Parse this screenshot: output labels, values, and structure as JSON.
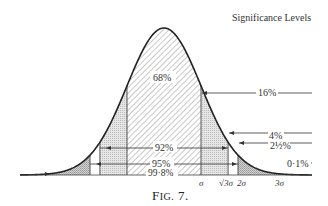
{
  "figure": {
    "title": "Significance Levels",
    "caption_prefix": "F",
    "caption_smallcaps": "IG.",
    "caption_number": " 7."
  },
  "labels": {
    "central": "68%",
    "right_16": "16%",
    "right_4": "4%",
    "right_2_5": "2½%",
    "right_0_1": "0·1%",
    "inner_92": "92%",
    "inner_95": "95%",
    "inner_99_8": "99·8%"
  },
  "axis": {
    "ticks": [
      "σ",
      "√3σ",
      "2σ",
      "3σ"
    ]
  },
  "chart_data": {
    "type": "area",
    "title": "Significance Levels",
    "caption": "Fig. 7.",
    "x_ticks": [
      "σ",
      "√3σ",
      "2σ",
      "3σ"
    ],
    "regions": [
      {
        "range": "-σ to σ",
        "percent_inside": 68,
        "tail_right": 16
      },
      {
        "range": "-√3σ to √3σ",
        "percent_inside": 92,
        "tail_right": 4
      },
      {
        "range": "-2σ to 2σ",
        "percent_inside": 95,
        "tail_right": 2.5
      },
      {
        "range": "-3σ to 3σ",
        "percent_inside": 99.8,
        "tail_right": 0.1
      }
    ]
  }
}
